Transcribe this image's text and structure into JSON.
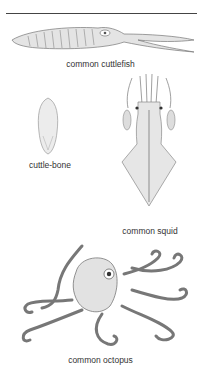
{
  "plate": {
    "figures": [
      {
        "id": "cuttlefish",
        "caption": "common cuttlefish"
      },
      {
        "id": "cuttlebone",
        "caption": "cuttle-bone"
      },
      {
        "id": "squid",
        "caption": "common squid"
      },
      {
        "id": "octopus",
        "caption": "common octopus"
      }
    ]
  },
  "colors": {
    "ink": "#555555",
    "fill": "#e4e4e4",
    "rule": "#444444"
  }
}
